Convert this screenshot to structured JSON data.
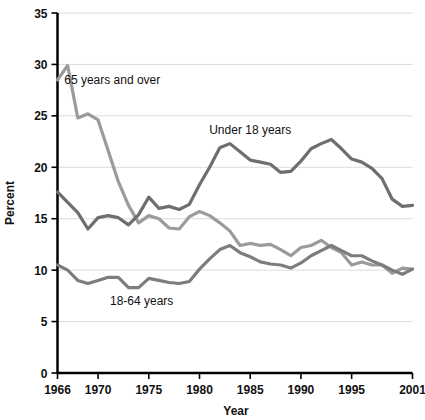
{
  "chart_data": {
    "type": "line",
    "title": "",
    "xlabel": "Year",
    "ylabel": "Percent",
    "xlim": [
      1966,
      2001
    ],
    "ylim": [
      0,
      35
    ],
    "yticks": [
      0,
      5,
      10,
      15,
      20,
      25,
      30,
      35
    ],
    "ytick_labels": [
      "0",
      "5",
      "10",
      "15",
      "20",
      "25",
      "30",
      "35"
    ],
    "xticks": [
      1966,
      1970,
      1975,
      1980,
      1985,
      1990,
      1995,
      2001
    ],
    "xtick_labels": [
      "1966",
      "1970",
      "1975",
      "1980",
      "1985",
      "1990",
      "1995",
      "2001"
    ],
    "grid": "horizontal",
    "legend_position": "inline-annotations",
    "x": [
      1966,
      1967,
      1968,
      1969,
      1970,
      1971,
      1972,
      1973,
      1974,
      1975,
      1976,
      1977,
      1978,
      1979,
      1980,
      1981,
      1982,
      1983,
      1984,
      1985,
      1986,
      1987,
      1988,
      1989,
      1990,
      1991,
      1992,
      1993,
      1994,
      1995,
      1996,
      1997,
      1998,
      1999,
      2000,
      2001
    ],
    "series": [
      {
        "name": "65 years and over",
        "color": "#9b9b9b",
        "label": "65 years and over",
        "label_x": 1971.4,
        "label_y": 28.1,
        "values": [
          28.5,
          29.9,
          24.8,
          25.2,
          24.6,
          21.6,
          18.6,
          16.3,
          14.6,
          15.3,
          15.0,
          14.1,
          14.0,
          15.2,
          15.7,
          15.3,
          14.6,
          13.8,
          12.4,
          12.6,
          12.4,
          12.5,
          12.0,
          11.4,
          12.2,
          12.4,
          12.9,
          12.2,
          11.7,
          10.5,
          10.8,
          10.5,
          10.5,
          9.7,
          10.2,
          10.1
        ]
      },
      {
        "name": "Under 18 years",
        "color": "#6e6e6e",
        "label": "Under 18 years",
        "label_x": 1985.0,
        "label_y": 23.2,
        "values": [
          17.6,
          16.6,
          15.6,
          14.0,
          15.1,
          15.3,
          15.1,
          14.4,
          15.4,
          17.1,
          16.0,
          16.2,
          15.9,
          16.4,
          18.3,
          20.0,
          21.9,
          22.3,
          21.5,
          20.7,
          20.5,
          20.3,
          19.5,
          19.6,
          20.6,
          21.8,
          22.3,
          22.7,
          21.8,
          20.8,
          20.5,
          19.9,
          18.9,
          16.9,
          16.2,
          16.3
        ]
      },
      {
        "name": "18-64 years",
        "color": "#7d7d7d",
        "label": "18-64 years",
        "label_x": 1974.3,
        "label_y": 6.6,
        "values": [
          10.5,
          10.0,
          9.0,
          8.7,
          9.0,
          9.3,
          9.3,
          8.3,
          8.3,
          9.2,
          9.0,
          8.8,
          8.7,
          8.9,
          10.1,
          11.1,
          12.0,
          12.4,
          11.7,
          11.3,
          10.8,
          10.6,
          10.5,
          10.2,
          10.7,
          11.4,
          11.9,
          12.4,
          11.9,
          11.4,
          11.4,
          10.9,
          10.5,
          10.0,
          9.6,
          10.1
        ]
      }
    ]
  },
  "axis": {
    "y_title": "Percent",
    "x_title": "Year"
  }
}
